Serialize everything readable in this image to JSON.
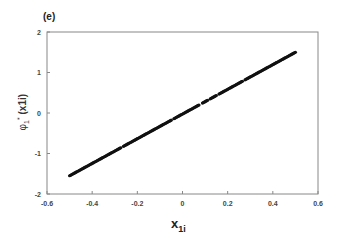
{
  "chart_data": {
    "type": "scatter",
    "panel_label": "(e)",
    "title": "",
    "xlabel": "x1i",
    "xlabel_main": "x",
    "xlabel_sub": "1i",
    "ylabel": "φ1*(x1i)",
    "ylabel_main": "φ",
    "ylabel_sub": "1",
    "ylabel_sup": "*",
    "ylabel_arg": "(x1i)",
    "xlim": [
      -0.6,
      0.6
    ],
    "ylim": [
      -2,
      2
    ],
    "xticks": [
      -0.6,
      -0.4,
      -0.2,
      0,
      0.2,
      0.4,
      0.6
    ],
    "xtick_labels": [
      "-0.6",
      "-0.4",
      "-0.2",
      "0",
      "0.2",
      "0.4",
      "0.6"
    ],
    "yticks": [
      -2,
      -1,
      0,
      1,
      2
    ],
    "ytick_labels": [
      "-2",
      "-1",
      "0",
      "1",
      "2"
    ],
    "grid": false,
    "legend": null,
    "series": [
      {
        "name": "phi1*(x1i)",
        "marker_color": "#111111",
        "x": [
          -0.5,
          -0.4,
          -0.3,
          -0.2,
          -0.1,
          0,
          0.1,
          0.2,
          0.3,
          0.4,
          0.5
        ],
        "y": [
          -1.55,
          -1.24,
          -0.94,
          -0.63,
          -0.33,
          -0.02,
          0.28,
          0.59,
          0.89,
          1.2,
          1.5
        ]
      }
    ],
    "trend": {
      "slope": 3.05,
      "intercept": -0.025,
      "x_range": [
        -0.5,
        0.5
      ]
    }
  },
  "colors": {
    "axis": "#888888",
    "points": "#111111",
    "background": "#ffffff"
  }
}
